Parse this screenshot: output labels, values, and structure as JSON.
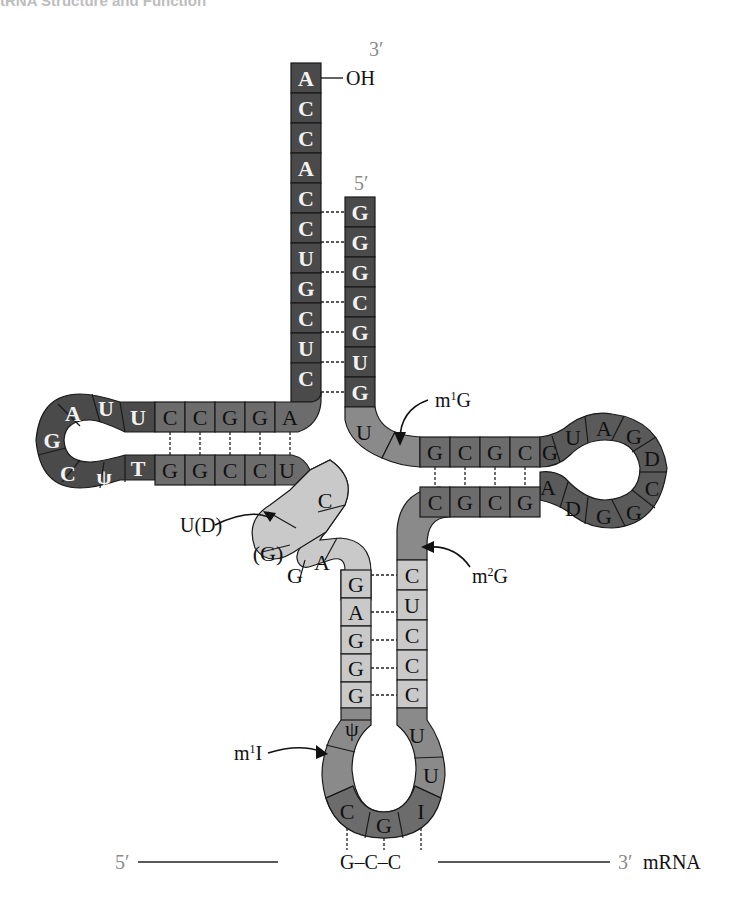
{
  "header": {
    "title": "tRNA Structure and Function"
  },
  "diagram": {
    "acceptor_stem": {
      "label_3prime": "3′",
      "label_oh": "OH",
      "label_5prime": "5′",
      "strand_3prime": [
        "A",
        "C",
        "C",
        "A",
        "C",
        "C",
        "U",
        "G",
        "C",
        "U",
        "C"
      ],
      "strand_5prime": [
        "G",
        "G",
        "G",
        "C",
        "G",
        "U",
        "G"
      ]
    },
    "tpsic_arm": {
      "top_stem": [
        "C",
        "C",
        "G",
        "G",
        "A"
      ],
      "bottom_stem": [
        "G",
        "G",
        "C",
        "C",
        "U"
      ],
      "loop": [
        "U",
        "U",
        "A",
        "G",
        "C",
        "ψ",
        "T"
      ]
    },
    "d_arm": {
      "connector": [
        "U",
        ""
      ],
      "top_stem": [
        "G",
        "C",
        "G",
        "C"
      ],
      "bottom_stem": [
        "C",
        "G",
        "C",
        "G"
      ],
      "loop": [
        "G",
        "U",
        "A",
        "G",
        "D",
        "C",
        "G",
        "G",
        "D",
        "A"
      ]
    },
    "variable_region": [
      "C",
      "",
      "(G)",
      "G",
      "A"
    ],
    "anticodon_arm": {
      "left_stem": [
        "G",
        "A",
        "G",
        "G",
        "G"
      ],
      "right_stem": [
        "C",
        "U",
        "C",
        "C",
        "C"
      ],
      "loop": [
        "ψ",
        "",
        "C",
        "G",
        "I",
        "U",
        "U"
      ]
    },
    "annotations": {
      "m1G": "m1G",
      "m2G": "m2G",
      "UD": "U(D)",
      "m1I": "m1I"
    },
    "mrna": {
      "label_5prime": "5′",
      "codon": "G–C–C",
      "label_3prime": "3′",
      "label": "mRNA"
    }
  }
}
